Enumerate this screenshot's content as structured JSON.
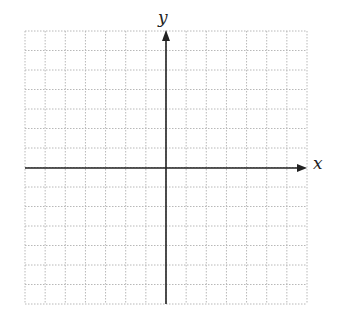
{
  "chart_data": {
    "type": "coordinate-grid",
    "title": "",
    "xlabel": "x",
    "ylabel": "y",
    "grid": true,
    "grid_style": "dotted",
    "columns": 14,
    "rows": 14,
    "x_range": [
      -7,
      7
    ],
    "y_range": [
      -7,
      7
    ],
    "tick_labels": false,
    "series": []
  },
  "labels": {
    "x_axis": "x",
    "y_axis": "y"
  },
  "colors": {
    "grid": "#b8b8b8",
    "axis": "#222222",
    "background": "#ffffff"
  },
  "geometry": {
    "grid_left": 25,
    "grid_top": 31,
    "grid_right": 307,
    "grid_bottom": 304,
    "origin_x": 166,
    "origin_y": 168
  }
}
